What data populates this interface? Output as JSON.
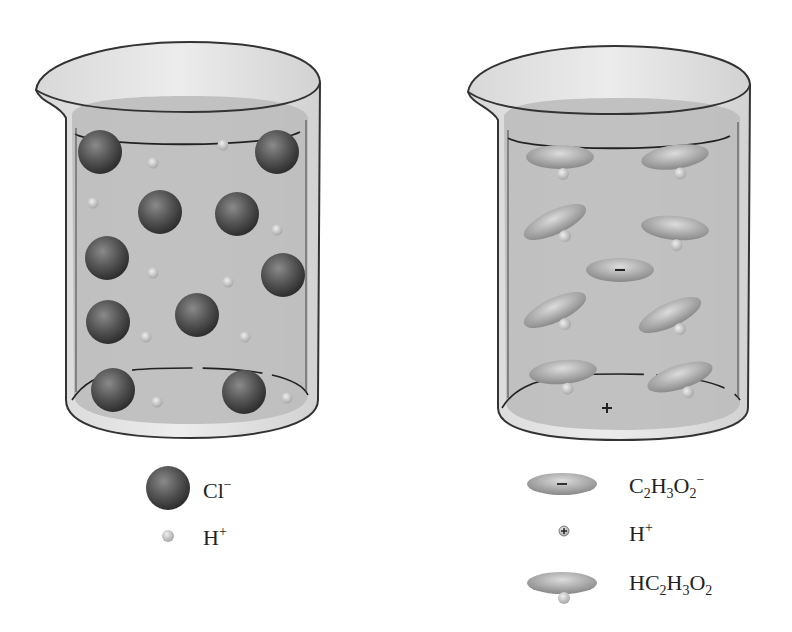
{
  "diagram": {
    "colors": {
      "solution": "#bdbdbd",
      "glass_outline": "#333333",
      "cl_ion": "#555555",
      "h_ion": "#c9c9c9",
      "acetate": "#a8a8a8"
    },
    "left_beaker": {
      "name": "HCl solution (strong acid)",
      "cl_ions": [
        [
          100,
          152
        ],
        [
          277,
          152
        ],
        [
          160,
          212
        ],
        [
          237,
          214
        ],
        [
          107,
          258
        ],
        [
          283,
          275
        ],
        [
          108,
          322
        ],
        [
          197,
          315
        ],
        [
          113,
          390
        ],
        [
          244,
          392
        ]
      ],
      "h_ions": [
        [
          153,
          163
        ],
        [
          223,
          145
        ],
        [
          93,
          203
        ],
        [
          277,
          230
        ],
        [
          153,
          273
        ],
        [
          228,
          282
        ],
        [
          146,
          337
        ],
        [
          245,
          337
        ],
        [
          157,
          402
        ],
        [
          287,
          398
        ]
      ]
    },
    "right_beaker": {
      "name": "HC2H3O2 solution (weak acid)",
      "molecules": [
        [
          560,
          157,
          0
        ],
        [
          675,
          157,
          -8
        ],
        [
          555,
          222,
          -25
        ],
        [
          675,
          228,
          5
        ],
        [
          555,
          310,
          -25
        ],
        [
          670,
          315,
          -25
        ],
        [
          563,
          372,
          -5
        ],
        [
          680,
          377,
          -18
        ]
      ],
      "acetate_ion": [
        620,
        270
      ],
      "h_ion": [
        607,
        408
      ]
    },
    "legend": {
      "left": [
        {
          "symbol": "Cl-sphere",
          "label_main": "Cl",
          "label_sup": "−"
        },
        {
          "symbol": "H-sphere",
          "label_main": "H",
          "label_sup": "+"
        }
      ],
      "right": [
        {
          "symbol": "acetate-ion",
          "parts": [
            [
              "C",
              ""
            ],
            [
              "2",
              "sub"
            ],
            [
              "H",
              ""
            ],
            [
              "3",
              "sub"
            ],
            [
              "O",
              ""
            ],
            [
              "2",
              "sub"
            ],
            [
              "−",
              "sup"
            ]
          ]
        },
        {
          "symbol": "hydrogen-ion",
          "parts": [
            [
              "H",
              ""
            ],
            [
              "+",
              "sup"
            ]
          ]
        },
        {
          "symbol": "acetic-acid",
          "parts": [
            [
              "HC",
              ""
            ],
            [
              "2",
              "sub"
            ],
            [
              "H",
              ""
            ],
            [
              "3",
              "sub"
            ],
            [
              "O",
              ""
            ],
            [
              "2",
              "sub"
            ]
          ]
        }
      ]
    }
  }
}
